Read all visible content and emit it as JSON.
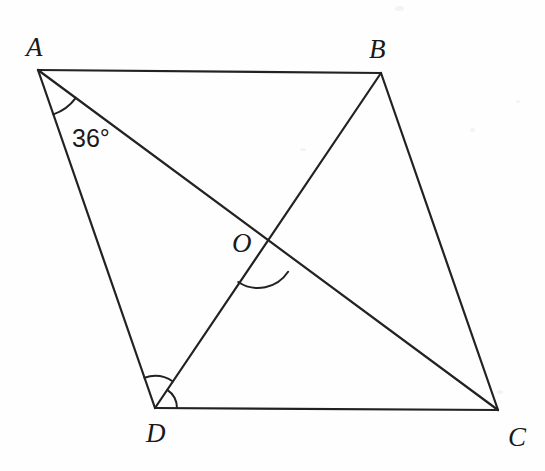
{
  "figure": {
    "kind": "geometry-diagram",
    "canvas": {
      "width": 545,
      "height": 471
    },
    "background_color": "#fefefe",
    "stroke_color": "#222222",
    "text_color": "#1a1a1a",
    "points": {
      "A": {
        "label": "A",
        "x": 38,
        "y": 70
      },
      "B": {
        "label": "B",
        "x": 381,
        "y": 73
      },
      "C": {
        "label": "C",
        "x": 498,
        "y": 410
      },
      "D": {
        "label": "D",
        "x": 155,
        "y": 408
      },
      "O": {
        "label": "O",
        "x": 258,
        "y": 252
      }
    },
    "segments": [
      {
        "name": "AB",
        "from": "A",
        "to": "B",
        "role": "side"
      },
      {
        "name": "BC",
        "from": "B",
        "to": "C",
        "role": "side"
      },
      {
        "name": "CD",
        "from": "C",
        "to": "D",
        "role": "side"
      },
      {
        "name": "DA",
        "from": "D",
        "to": "A",
        "role": "side"
      },
      {
        "name": "AC",
        "from": "A",
        "to": "C",
        "role": "diagonal"
      },
      {
        "name": "BD",
        "from": "B",
        "to": "D",
        "role": "diagonal"
      }
    ],
    "angle_marks": [
      {
        "name": "angle-DAC",
        "vertex": "A",
        "value": "36°",
        "labeled": true,
        "arcs": 1
      },
      {
        "name": "angle-DOC",
        "vertex": "O",
        "value": "",
        "labeled": false,
        "arcs": 1
      },
      {
        "name": "angle-ADO",
        "vertex": "D",
        "value": "",
        "labeled": false,
        "arcs": 1
      },
      {
        "name": "angle-ODC",
        "vertex": "D",
        "value": "",
        "labeled": false,
        "arcs": 1
      }
    ],
    "labels": {
      "A": "A",
      "B": "B",
      "C": "C",
      "D": "D",
      "O": "O",
      "angle_at_A": "36°"
    }
  }
}
